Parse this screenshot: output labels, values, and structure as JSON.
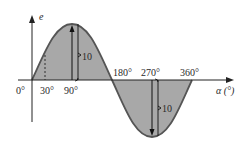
{
  "diagram": {
    "y_axis_label": "e",
    "x_axis_label": "α (°)",
    "tick_labels": {
      "deg0": "0°",
      "deg30": "30°",
      "deg90": "90°",
      "deg180": "180°",
      "deg270": "270°",
      "deg360": "360°"
    },
    "amplitude_labels": {
      "positive_peak": "10",
      "negative_peak": "10"
    },
    "colors": {
      "fill": "#a8a8a8",
      "curve": "#555555",
      "axis": "#222222"
    }
  }
}
